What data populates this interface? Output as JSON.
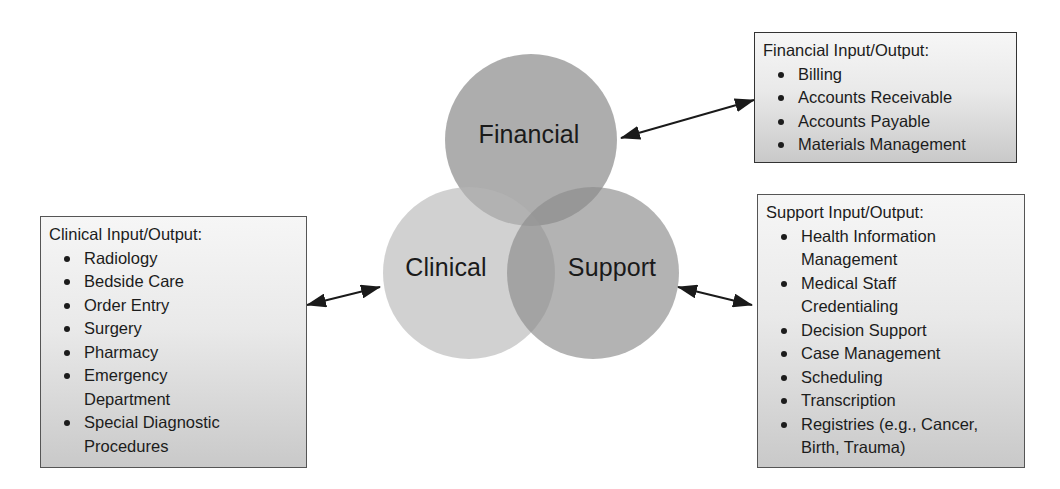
{
  "venn": {
    "circles": [
      {
        "id": "financial",
        "label": "Financial"
      },
      {
        "id": "clinical",
        "label": "Clinical"
      },
      {
        "id": "support",
        "label": "Support"
      }
    ],
    "colors": {
      "financial_fill": "#9a9a9a",
      "clinical_fill": "#c8c8c8",
      "support_fill": "#a6a6a6",
      "arrow": "#1a1a1a",
      "box_border": "#555555"
    }
  },
  "boxes": {
    "clinical": {
      "title": "Clinical Input/Output:",
      "items": [
        "Radiology",
        "Bedside Care",
        "Order Entry",
        "Surgery",
        "Pharmacy",
        "Emergency Department",
        "Special Diagnostic Procedures"
      ]
    },
    "financial": {
      "title": "Financial Input/Output:",
      "items": [
        "Billing",
        "Accounts Receivable",
        "Accounts Payable",
        "Materials Management"
      ]
    },
    "support": {
      "title": "Support Input/Output:",
      "items": [
        "Health Information Management",
        "Medical Staff Credentialing",
        "Decision Support",
        "Case Management",
        "Scheduling",
        "Transcription",
        "Registries (e.g., Cancer, Birth, Trauma)"
      ]
    }
  }
}
